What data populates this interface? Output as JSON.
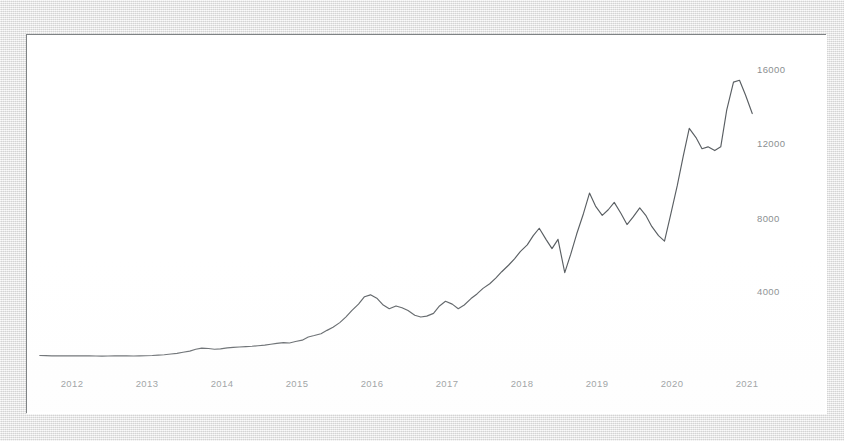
{
  "chart_data": {
    "type": "line",
    "title": "",
    "subtitle": "",
    "xlabel": "",
    "ylabel": "",
    "xlim": [
      2011.83,
      2021.5
    ],
    "ylim": [
      0,
      17000
    ],
    "grid": false,
    "legend": null,
    "line_color": "#5a5f63",
    "background_color": "#ffffff",
    "x_tick_labels": [
      "2012",
      "2013",
      "2014",
      "2015",
      "2016",
      "2017",
      "2018",
      "2019",
      "2020",
      "2021"
    ],
    "x_tick_values": [
      2012,
      2013,
      2014,
      2015,
      2016,
      2017,
      2018,
      2019,
      2020,
      2021
    ],
    "y_tick_labels": [
      "4000",
      "8000",
      "12000",
      "16000"
    ],
    "y_tick_values": [
      4000,
      8000,
      12000,
      16000
    ],
    "series": [
      {
        "name": "value",
        "x": [
          2011.92,
          2012.0,
          2012.08,
          2012.17,
          2012.25,
          2012.33,
          2012.42,
          2012.5,
          2012.58,
          2012.67,
          2012.75,
          2012.83,
          2012.92,
          2013.0,
          2013.08,
          2013.17,
          2013.25,
          2013.33,
          2013.42,
          2013.5,
          2013.58,
          2013.67,
          2013.75,
          2013.83,
          2013.92,
          2014.0,
          2014.08,
          2014.17,
          2014.25,
          2014.33,
          2014.42,
          2014.5,
          2014.58,
          2014.67,
          2014.75,
          2014.83,
          2014.92,
          2015.0,
          2015.08,
          2015.17,
          2015.25,
          2015.33,
          2015.42,
          2015.5,
          2015.58,
          2015.67,
          2015.75,
          2015.83,
          2015.92,
          2016.0,
          2016.08,
          2016.17,
          2016.25,
          2016.33,
          2016.42,
          2016.5,
          2016.58,
          2016.67,
          2016.75,
          2016.83,
          2016.92,
          2017.0,
          2017.08,
          2017.17,
          2017.25,
          2017.33,
          2017.42,
          2017.5,
          2017.58,
          2017.67,
          2017.75,
          2017.83,
          2017.92,
          2018.0,
          2018.08,
          2018.17,
          2018.25,
          2018.33,
          2018.42,
          2018.5,
          2018.58,
          2018.67,
          2018.75,
          2018.83,
          2018.92,
          2019.0,
          2019.08,
          2019.17,
          2019.25,
          2019.33,
          2019.42,
          2019.5,
          2019.58,
          2019.67,
          2019.75,
          2019.83,
          2019.92,
          2020.0,
          2020.08,
          2020.17,
          2020.25,
          2020.33,
          2020.42,
          2020.5,
          2020.58,
          2020.67,
          2020.75,
          2020.83,
          2020.92,
          2021.0,
          2021.08,
          2021.17,
          2021.25,
          2021.33,
          2021.42
        ],
        "values": [
          620,
          615,
          600,
          600,
          610,
          605,
          600,
          610,
          600,
          595,
          590,
          595,
          600,
          610,
          600,
          595,
          600,
          610,
          620,
          640,
          660,
          700,
          740,
          800,
          860,
          960,
          1020,
          1000,
          960,
          980,
          1030,
          1060,
          1080,
          1100,
          1120,
          1150,
          1180,
          1230,
          1280,
          1320,
          1300,
          1380,
          1450,
          1620,
          1700,
          1800,
          1980,
          2150,
          2400,
          2700,
          3050,
          3400,
          3800,
          3900,
          3700,
          3350,
          3150,
          3300,
          3200,
          3050,
          2800,
          2700,
          2750,
          2900,
          3300,
          3550,
          3400,
          3150,
          3350,
          3700,
          3950,
          4250,
          4500,
          4800,
          5150,
          5500,
          5850,
          6250,
          6600,
          7100,
          7500,
          6900,
          6400,
          6900,
          5100,
          6100,
          7200,
          8300,
          9400,
          8700,
          8200,
          8500,
          8900,
          8300,
          7700,
          8100,
          8600,
          8200,
          7600,
          7100,
          6800,
          8200,
          9800,
          11400,
          12900,
          12400,
          11800,
          11900,
          11700,
          11900,
          13900,
          15400,
          15500,
          14700,
          13700
        ]
      }
    ]
  },
  "axis": {
    "y_ticks": [
      {
        "label": "16000",
        "top": 64
      },
      {
        "label": "12000",
        "top": 138
      },
      {
        "label": "8000",
        "top": 213
      },
      {
        "label": "4000",
        "top": 286
      }
    ],
    "x_ticks": [
      {
        "label": "2012",
        "left": 59
      },
      {
        "label": "2013",
        "left": 134
      },
      {
        "label": "2014",
        "left": 209
      },
      {
        "label": "2015",
        "left": 284
      },
      {
        "label": "2016",
        "left": 359
      },
      {
        "label": "2017",
        "left": 434
      },
      {
        "label": "2018",
        "left": 509
      },
      {
        "label": "2019",
        "left": 584
      },
      {
        "label": "2020",
        "left": 659
      },
      {
        "label": "2021",
        "left": 734
      }
    ]
  }
}
